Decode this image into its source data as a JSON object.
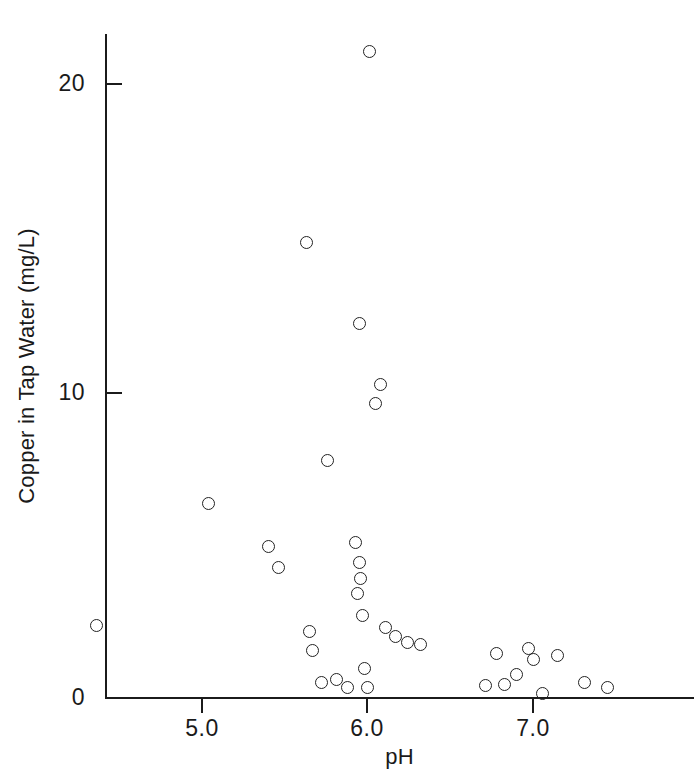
{
  "chart_data": {
    "type": "scatter",
    "title": "",
    "xlabel": "pH",
    "ylabel": "Copper in Tap Water (mg/L)",
    "xlim": [
      4.25,
      7.6
    ],
    "ylim": [
      0,
      22.3
    ],
    "grid": false,
    "legend": null,
    "marker": "open-circle",
    "xticks": [
      5.0,
      6.0,
      7.0
    ],
    "xtick_labels": [
      "5.0",
      "6.0",
      "7.0"
    ],
    "yticks": [
      0,
      10,
      20
    ],
    "ytick_labels": [
      "0",
      "10",
      "20"
    ],
    "series": [
      {
        "name": "Tap water samples",
        "x": [
          4.36,
          5.04,
          5.4,
          5.46,
          5.63,
          5.65,
          5.67,
          5.72,
          5.76,
          5.81,
          5.88,
          5.93,
          5.94,
          5.95,
          5.95,
          5.96,
          5.97,
          5.98,
          6.0,
          6.01,
          6.05,
          6.08,
          6.11,
          6.17,
          6.24,
          6.32,
          6.71,
          6.78,
          6.83,
          6.9,
          6.97,
          7.0,
          7.06,
          7.15,
          7.31,
          7.45
        ],
        "y": [
          2.35,
          6.35,
          4.95,
          4.25,
          14.85,
          2.15,
          1.55,
          0.5,
          7.75,
          0.6,
          0.35,
          5.05,
          3.4,
          12.2,
          4.4,
          3.9,
          2.7,
          0.95,
          0.35,
          21.05,
          9.6,
          10.2,
          2.3,
          2.0,
          1.8,
          1.75,
          0.4,
          1.45,
          0.45,
          0.75,
          1.6,
          1.25,
          0.15,
          1.4,
          0.5,
          0.35
        ]
      }
    ]
  },
  "axes": {
    "y_title": "Copper in Tap Water (mg/L)",
    "x_title": "pH",
    "y_tick_labels": [
      "20",
      "10",
      "0"
    ],
    "x_tick_labels": [
      "5.0",
      "6.0",
      "7.0"
    ]
  },
  "colors": {
    "axis": "#1b1b1b",
    "marker_stroke": "#222222",
    "background": "#ffffff"
  }
}
